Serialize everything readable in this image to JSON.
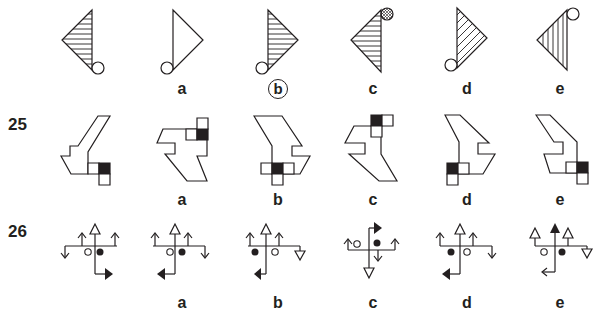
{
  "questions": [
    {
      "number": "",
      "type": "mirror-image",
      "figure": "right triangle with circle at vertex, horizontal hatching",
      "options": [
        {
          "label": "a",
          "description": "unshaded triangle pointing right, circle bottom-left"
        },
        {
          "label": "b",
          "description": "horizontally hatched triangle pointing right, circle bottom-left",
          "selected": true
        },
        {
          "label": "c",
          "description": "horizontally hatched triangle pointing left, cross-hatched circle top-right"
        },
        {
          "label": "d",
          "description": "diagonally hatched triangle pointing right, circle bottom-left"
        },
        {
          "label": "e",
          "description": "vertically hatched triangle pointing left, circle top-right"
        }
      ],
      "answer": "b"
    },
    {
      "number": "25",
      "type": "mirror-image",
      "figure": "angular polygon with black and white squares",
      "options": [
        {
          "label": "a"
        },
        {
          "label": "b"
        },
        {
          "label": "c"
        },
        {
          "label": "d"
        },
        {
          "label": "e"
        }
      ]
    },
    {
      "number": "26",
      "type": "mirror-image",
      "figure": "cross of arrows with open and filled dots",
      "options": [
        {
          "label": "a"
        },
        {
          "label": "b"
        },
        {
          "label": "c"
        },
        {
          "label": "d"
        },
        {
          "label": "e"
        }
      ]
    }
  ],
  "labels": {
    "q25": "25",
    "q26": "26",
    "r1": [
      "a",
      "b",
      "c",
      "d",
      "e"
    ],
    "r2": [
      "a",
      "b",
      "c",
      "d",
      "e"
    ],
    "r3": [
      "a",
      "b",
      "c",
      "d",
      "e"
    ]
  },
  "colors": {
    "ink": "#231f20",
    "paper": "#ffffff"
  }
}
